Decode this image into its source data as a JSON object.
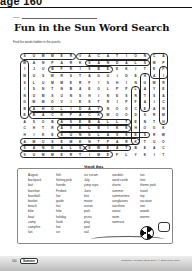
{
  "page_header": "age 160",
  "name_label": "Name",
  "title": "Fun in the Sun Word Search",
  "instructions": "Find the words hidden in the puzzle.",
  "grid": {
    "rows": [
      "SUMMERVACATIONCA",
      "WANPARKSANDALSMP",
      "IJUBFRISBEEKITEF",
      "MUSWRSTAGUIDEHAI",
      "SLUMMERFISHINGWR",
      "ISNTNBAEOLPPLAYE",
      "NUMSUNSHINESRTSA",
      "GWMOVIESTRIPFAIC",
      "BAHOLIDAYNOOCEAN",
      "EBACKPACKWOODSRM",
      "ASOBASEBALLTENTH",
      "CHTRAVELBIKEHOOK",
      "HIKESUNGLASSESRW",
      "AMUSEMENTPARKTUO",
      "SANDALSSWEATBEAC",
      "SUMMERTIMEFLYKIT"
    ]
  },
  "word_box": {
    "title": "Word Box",
    "columns": [
      [
        "August",
        "backpack",
        "bait",
        "barefoot",
        "baseball",
        "basket",
        "beach",
        "bike",
        "boat",
        "camp",
        "campfire",
        "fan"
      ],
      [
        "fish",
        "fishing pole",
        "friends",
        "Frisbee",
        "fun",
        "guide",
        "hat",
        "hike",
        "holiday",
        "hook",
        "hot",
        "ice"
      ],
      [
        "ice cream",
        "July",
        "jump rope",
        "June",
        "kite",
        "movie",
        "ocean",
        "park",
        "picnic",
        "play",
        "pool",
        "sail"
      ],
      [
        "sandals",
        "sand castle",
        "shorts",
        "summer",
        "summertime",
        "sunglasses",
        "sunshine",
        "sweat",
        "swim",
        "swimsuit"
      ],
      [
        "tan",
        "tent",
        "theme park",
        "travel",
        "trip",
        "vacation",
        "van",
        "woods",
        "worms"
      ]
    ]
  },
  "footer": {
    "page_number": "160",
    "badge": "Summer",
    "copyright": "Seasonal Activities • EMC 2904 • © Evan-Moor Corp."
  }
}
